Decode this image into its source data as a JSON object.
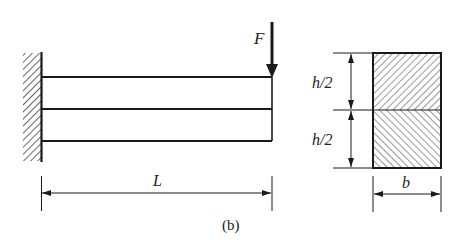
{
  "figure": {
    "caption": "(b)",
    "beam": {
      "support": "fixed wall",
      "length_label": "L",
      "layers": 2
    },
    "load": {
      "label": "F",
      "direction": "down"
    },
    "cross_section": {
      "top_height_label": "h/2",
      "bottom_height_label": "h/2",
      "width_label": "b"
    }
  },
  "colors": {
    "line": "#1a1a1a",
    "background": "#ffffff"
  }
}
